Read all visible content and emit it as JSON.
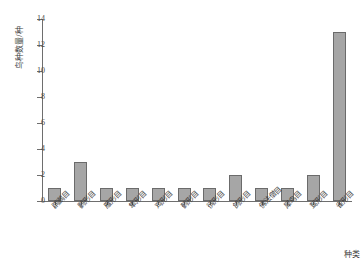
{
  "chart_data": {
    "type": "bar",
    "title": "",
    "xlabel": "种类",
    "ylabel": "鸟种数量/种",
    "ylim": [
      0,
      14
    ],
    "yticks": [
      0,
      2,
      4,
      6,
      8,
      10,
      12,
      14
    ],
    "grid": false,
    "legend": null,
    "bar_color": "#a6a6a6",
    "bar_edge_color": "#6b6b6b",
    "axis_color": "#6e6e6e",
    "categories": [
      "䴙䴘目",
      "鹳形目",
      "雁形目",
      "隼形目",
      "鸡形目",
      "鹤形目",
      "鸻形目",
      "鸽形目",
      "佛法僧目",
      "犀鸟目",
      "䴕形目",
      "雀形目"
    ],
    "values": [
      1,
      3,
      1,
      1,
      1,
      1,
      1,
      2,
      1,
      1,
      2,
      13
    ]
  }
}
